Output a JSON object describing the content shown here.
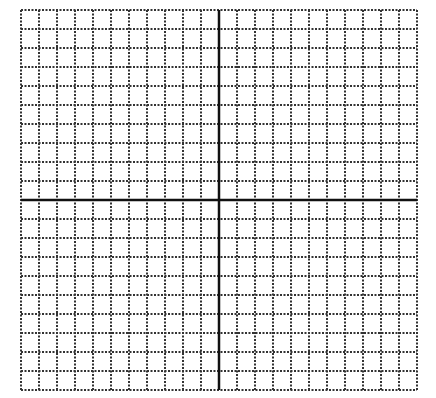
{
  "grid": {
    "left": 21,
    "top": 10,
    "cols": 22,
    "rows": 20,
    "cell_w": 18,
    "cell_h": 19,
    "y_axis_col": 11,
    "x_axis_row": 10,
    "line_color": "#333333",
    "axis_color": "#111111",
    "background": "#ffffff"
  }
}
